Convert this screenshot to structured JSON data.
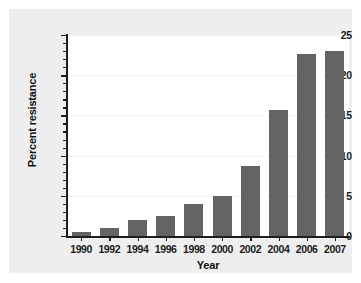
{
  "chart_data": {
    "type": "bar",
    "title": "",
    "subtitle": "",
    "xlabel": "Year",
    "ylabel": "Percent resistance",
    "categories": [
      "1990",
      "1992",
      "1994",
      "1996",
      "1998",
      "2000",
      "2002",
      "2004",
      "2006",
      "2007"
    ],
    "values": [
      0.5,
      1.0,
      2.0,
      2.5,
      4.0,
      5.0,
      8.7,
      15.7,
      22.6,
      23.0
    ],
    "series": [
      {
        "name": "Percent resistance",
        "values": [
          0.5,
          1.0,
          2.0,
          2.5,
          4.0,
          5.0,
          8.7,
          15.7,
          22.6,
          23.0
        ]
      }
    ],
    "ylim": [
      0,
      25
    ],
    "ytick_labels": [
      "0",
      "5",
      "10",
      "15",
      "20",
      "25"
    ],
    "ytick_values": [
      0,
      5,
      10,
      15,
      20,
      25
    ],
    "yminor_interval": 1,
    "xtick_labels": [
      "1990",
      "1992",
      "1994",
      "1996",
      "1998",
      "2000",
      "2002",
      "2004",
      "2006",
      "2007"
    ],
    "grid": true,
    "legend": null,
    "legend_position": "none",
    "annotations": [],
    "colors": {
      "bar": "#646464",
      "axis": "#1d1d1d",
      "grid": "#f4f4f4",
      "plot_background": "#ffffff",
      "figure_background": "#eeeeee",
      "page_background": "#ffffff",
      "text": "#111111"
    }
  }
}
